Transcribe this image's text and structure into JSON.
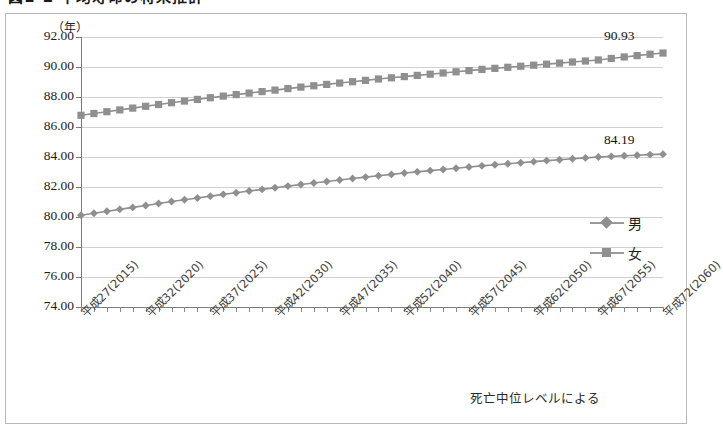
{
  "title": {
    "text": "図1-2 平均寿命の将来推計",
    "clipped": true
  },
  "unit_label": "（年）",
  "footnote": "死亡中位レベルによる",
  "legend": {
    "position": "right-middle",
    "entries": [
      {
        "label": "男",
        "marker": "diamond",
        "color": "#8f8f8f"
      },
      {
        "label": "女",
        "marker": "square",
        "color": "#8f8f8f"
      }
    ]
  },
  "annotations": [
    {
      "name": "female-end-label",
      "text": "90.93",
      "series": "女",
      "x": "平成72(2060)"
    },
    {
      "name": "male-end-label",
      "text": "84.19",
      "series": "男",
      "x": "平成72(2060)"
    }
  ],
  "chart_data": {
    "type": "line",
    "title": "図1-2 平均寿命の将来推計",
    "xlabel": "",
    "ylabel": "（年）",
    "ylim": [
      74.0,
      92.0
    ],
    "ytick_step": 2.0,
    "ytick_labels": [
      "92.00",
      "90.00",
      "88.00",
      "86.00",
      "84.00",
      "82.00",
      "80.00",
      "78.00",
      "76.00",
      "74.00"
    ],
    "grid": true,
    "legend_position": "right",
    "x_tick_labels": [
      "平成27(2015)",
      "平成32(2020)",
      "平成37(2025)",
      "平成42(2030)",
      "平成47(2035)",
      "平成52(2040)",
      "平成57(2045)",
      "平成62(2050)",
      "平成67(2055)",
      "平成72(2060)"
    ],
    "x_tick_years": [
      2015,
      2020,
      2025,
      2030,
      2035,
      2040,
      2045,
      2050,
      2055,
      2060
    ],
    "x": [
      2015,
      2016,
      2017,
      2018,
      2019,
      2020,
      2021,
      2022,
      2023,
      2024,
      2025,
      2026,
      2027,
      2028,
      2029,
      2030,
      2031,
      2032,
      2033,
      2034,
      2035,
      2036,
      2037,
      2038,
      2039,
      2040,
      2041,
      2042,
      2043,
      2044,
      2045,
      2046,
      2047,
      2048,
      2049,
      2050,
      2051,
      2052,
      2053,
      2054,
      2055,
      2056,
      2057,
      2058,
      2059,
      2060
    ],
    "series": [
      {
        "name": "男",
        "marker": "diamond",
        "color": "#8f8f8f",
        "end_label": "84.19",
        "values": [
          80.12,
          80.25,
          80.38,
          80.51,
          80.64,
          80.77,
          80.9,
          81.03,
          81.15,
          81.27,
          81.39,
          81.51,
          81.62,
          81.73,
          81.84,
          81.95,
          82.06,
          82.17,
          82.27,
          82.37,
          82.47,
          82.57,
          82.66,
          82.75,
          82.84,
          82.93,
          83.01,
          83.09,
          83.17,
          83.25,
          83.33,
          83.41,
          83.48,
          83.55,
          83.62,
          83.69,
          83.76,
          83.82,
          83.88,
          83.94,
          84.0,
          84.04,
          84.08,
          84.12,
          84.16,
          84.19
        ]
      },
      {
        "name": "女",
        "marker": "square",
        "color": "#8f8f8f",
        "end_label": "90.93",
        "values": [
          86.78,
          86.9,
          87.02,
          87.14,
          87.26,
          87.38,
          87.5,
          87.62,
          87.73,
          87.84,
          87.95,
          88.06,
          88.16,
          88.26,
          88.36,
          88.46,
          88.56,
          88.66,
          88.75,
          88.84,
          88.93,
          89.02,
          89.11,
          89.2,
          89.28,
          89.36,
          89.44,
          89.52,
          89.6,
          89.68,
          89.76,
          89.84,
          89.91,
          89.98,
          90.05,
          90.12,
          90.19,
          90.26,
          90.33,
          90.4,
          90.47,
          90.57,
          90.67,
          90.76,
          90.85,
          90.93
        ]
      }
    ]
  }
}
